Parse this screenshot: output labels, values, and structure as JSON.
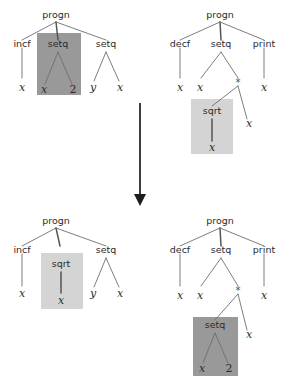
{
  "figure": {
    "background": "#ffffff",
    "width": 287,
    "height": 377,
    "colors": {
      "highlight_dark": "#999999",
      "highlight_light": "#d4d4d4",
      "edge": "#6e6e6e",
      "edge_bold": "#555555",
      "text": "#2b2b2b",
      "arrow": "#1d1d1d"
    }
  },
  "arrow": {
    "name": "downward-transformation-arrow",
    "label": ""
  },
  "trees": {
    "top_left": {
      "name": "parent-tree-1",
      "root": "progn",
      "children": [
        "incf",
        "setq",
        "setq"
      ],
      "highlight": {
        "node": "setq",
        "shade": "dark",
        "subtree_labels": [
          "setq",
          "x",
          "2"
        ]
      },
      "labels": {
        "root": "progn",
        "c1": "incf",
        "c1_leaf": "x",
        "c2": "setq",
        "c2_leaf_left": "x",
        "c2_leaf_right": "2",
        "c3": "setq",
        "c3_leaf_left": "y",
        "c3_leaf_right": "x"
      }
    },
    "top_right": {
      "name": "parent-tree-2",
      "root": "progn",
      "children": [
        "decf",
        "setq",
        "print"
      ],
      "highlight": {
        "node": "sqrt",
        "shade": "light",
        "subtree_labels": [
          "sqrt",
          "x"
        ]
      },
      "labels": {
        "root": "progn",
        "c1": "decf",
        "c1_leaf": "x",
        "c2": "setq",
        "c2_leaf_left": "x",
        "c2_op": "*",
        "op_left": "sqrt",
        "op_left_leaf": "x",
        "op_right_leaf": "x",
        "c3": "print",
        "c3_leaf": "x"
      }
    },
    "bottom_left": {
      "name": "offspring-tree-1",
      "root": "progn",
      "children": [
        "incf",
        "sqrt",
        "setq"
      ],
      "highlight": {
        "node": "sqrt",
        "shade": "light",
        "subtree_labels": [
          "sqrt",
          "x"
        ]
      },
      "labels": {
        "root": "progn",
        "c1": "incf",
        "c1_leaf": "x",
        "c2": "sqrt",
        "c2_leaf": "x",
        "c3": "setq",
        "c3_leaf_left": "y",
        "c3_leaf_right": "x"
      }
    },
    "bottom_right": {
      "name": "offspring-tree-2",
      "root": "progn",
      "children": [
        "decf",
        "setq",
        "print"
      ],
      "highlight": {
        "node": "setq",
        "shade": "dark",
        "subtree_labels": [
          "setq",
          "x",
          "2"
        ]
      },
      "labels": {
        "root": "progn",
        "c1": "decf",
        "c1_leaf": "x",
        "c2": "setq",
        "c2_leaf_left": "x",
        "c2_op": "*",
        "op_left": "setq",
        "op_left_leaf_left": "x",
        "op_left_leaf_right": "2",
        "op_right_leaf": "x",
        "c3": "print",
        "c3_leaf": "x"
      }
    }
  }
}
